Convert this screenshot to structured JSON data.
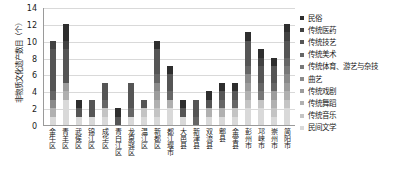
{
  "chart_data": {
    "type": "bar",
    "stacked": true,
    "title": "",
    "xlabel": "",
    "ylabel": "非物质文化遗产数目（个）",
    "ylim": [
      0,
      14
    ],
    "yticks": [
      0,
      2,
      4,
      6,
      8,
      10,
      12,
      14
    ],
    "grid": true,
    "legend_position": "right",
    "categories": [
      "金牛区",
      "青羊区",
      "武侯区",
      "锦江区",
      "成华区",
      "青白江区",
      "龙泉驿区",
      "温江区",
      "新都区",
      "都江堰市",
      "大邑县",
      "新津县",
      "双流县",
      "郫县",
      "金堂县",
      "彭州市",
      "邛崃市",
      "崇州市",
      "简阳市"
    ],
    "series": [
      {
        "name": "民间文学",
        "color": "#d9d9d9",
        "values": [
          1,
          3,
          1,
          1,
          1,
          0,
          1,
          1,
          1,
          2,
          1,
          0,
          1,
          1,
          1,
          2,
          2,
          1,
          2
        ]
      },
      {
        "name": "传统音乐",
        "color": "#c4c4c4",
        "values": [
          0,
          0,
          0,
          0,
          1,
          0,
          0,
          1,
          1,
          0,
          0,
          0,
          0,
          0,
          1,
          1,
          1,
          1,
          1
        ]
      },
      {
        "name": "传统舞蹈",
        "color": "#b0b0b0",
        "values": [
          1,
          1,
          0,
          0,
          0,
          0,
          0,
          0,
          1,
          1,
          0,
          0,
          1,
          1,
          0,
          1,
          0,
          1,
          1
        ]
      },
      {
        "name": "传统戏剧",
        "color": "#9c9c9c",
        "values": [
          0,
          1,
          0,
          0,
          0,
          0,
          0,
          0,
          1,
          0,
          0,
          0,
          0,
          0,
          0,
          1,
          0,
          1,
          1
        ]
      },
      {
        "name": "曲艺",
        "color": "#8a8a8a",
        "values": [
          1,
          0,
          0,
          0,
          0,
          0,
          0,
          0,
          1,
          0,
          0,
          0,
          0,
          0,
          0,
          1,
          0,
          0,
          1
        ]
      },
      {
        "name": "传统体育、游艺与杂技",
        "color": "#787878",
        "values": [
          0,
          0,
          0,
          0,
          0,
          0,
          0,
          0,
          0,
          0,
          0,
          0,
          0,
          0,
          0,
          0,
          1,
          0,
          1
        ]
      },
      {
        "name": "传统美术",
        "color": "#666666",
        "values": [
          1,
          0,
          0,
          0,
          1,
          0,
          1,
          0,
          1,
          1,
          0,
          1,
          0,
          1,
          1,
          1,
          1,
          1,
          1
        ]
      },
      {
        "name": "传统技艺",
        "color": "#555555",
        "values": [
          5,
          4,
          1,
          2,
          2,
          1,
          3,
          1,
          3,
          2,
          1,
          2,
          1,
          1,
          1,
          3,
          2,
          2,
          2
        ]
      },
      {
        "name": "传统医药",
        "color": "#424242",
        "values": [
          1,
          1,
          0,
          0,
          0,
          0,
          0,
          0,
          0,
          0,
          0,
          0,
          0,
          0,
          0,
          0,
          1,
          0,
          1
        ]
      },
      {
        "name": "民俗",
        "color": "#2e2e2e",
        "values": [
          0,
          2,
          1,
          0,
          0,
          1,
          0,
          0,
          1,
          1,
          1,
          0,
          1,
          1,
          1,
          1,
          1,
          1,
          1
        ]
      }
    ],
    "totals": [
      10,
      12,
      3,
      3,
      5,
      2,
      5,
      3,
      10,
      7,
      3,
      3,
      4,
      5,
      5,
      11,
      9,
      8,
      12
    ]
  },
  "legend": {
    "items": [
      {
        "label": "民俗",
        "color": "#2e2e2e"
      },
      {
        "label": "传统医药",
        "color": "#424242"
      },
      {
        "label": "传统技艺",
        "color": "#555555"
      },
      {
        "label": "传统美术",
        "color": "#666666"
      },
      {
        "label": "传统体育、游艺与杂技",
        "color": "#787878"
      },
      {
        "label": "曲艺",
        "color": "#8a8a8a"
      },
      {
        "label": "传统戏剧",
        "color": "#9c9c9c"
      },
      {
        "label": "传统舞蹈",
        "color": "#b0b0b0"
      },
      {
        "label": "传统音乐",
        "color": "#c4c4c4"
      },
      {
        "label": "民间文学",
        "color": "#d9d9d9"
      }
    ]
  }
}
